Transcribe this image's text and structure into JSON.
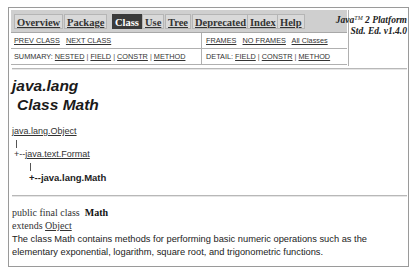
{
  "nav": {
    "tabs": [
      {
        "label": "Overview",
        "selected": false
      },
      {
        "label": "Package",
        "selected": false
      },
      {
        "label": "Class",
        "selected": true
      },
      {
        "label": "Use",
        "selected": false
      },
      {
        "label": "Tree",
        "selected": false
      },
      {
        "label": "Deprecated",
        "selected": false
      },
      {
        "label": "Index",
        "selected": false
      },
      {
        "label": "Help",
        "selected": false
      }
    ],
    "prev_class": "PREV CLASS",
    "next_class": "NEXT CLASS",
    "frames": "FRAMES",
    "no_frames": "NO FRAMES",
    "all_classes": "All Classes",
    "summary_label": "SUMMARY:",
    "summary_links": [
      "NESTED",
      "FIELD",
      "CONSTR",
      "METHOD"
    ],
    "detail_label": "DETAIL:",
    "detail_links": [
      "FIELD",
      "CONSTR",
      "METHOD"
    ],
    "separator": "|"
  },
  "platform": {
    "line1_prefix": "Java",
    "line1_tm": "TM",
    "line1_suffix": " 2 Platform",
    "line2": "Std. Ed. v1.4.0"
  },
  "header": {
    "package": "java.lang",
    "class_title": "Class Math"
  },
  "tree": {
    "root": "java.lang.Object",
    "mid_prefix": "+--",
    "mid": "java.text.Format",
    "leaf_prefix": "+--",
    "leaf": "java.lang.Math"
  },
  "declaration": {
    "modifiers": "public final class ",
    "name": "Math",
    "extends_label": "extends ",
    "extends_link": "Object"
  },
  "description": "The class Math contains methods for performing basic numeric operations such as the elementary exponential, logarithm, square root, and trigonometric functions.",
  "colors": {
    "nav_bg": "#cfcfcf",
    "selected_tab_bg": "#3a3a3a",
    "selected_tab_text": "#ffffff",
    "border": "#9a9a9a"
  }
}
